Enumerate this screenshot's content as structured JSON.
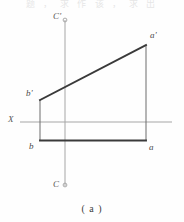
{
  "figure": {
    "caption": "( a )",
    "partial_header_text": "题 ， 求 作 该 ， 求 出",
    "background_color": "#fefefe",
    "axis_color": "#9a9a9a",
    "projection_line_color": "#4d4d4d",
    "heavy_line_color": "#3a3a3a",
    "label_color": "#4a4a4a"
  },
  "axes": {
    "horizontal": {
      "name": "X",
      "label": "X",
      "label_x": 8,
      "label_y": 116,
      "y": 122,
      "x_start": 20,
      "x_end": 172,
      "color": "#a6a6a6"
    },
    "vertical": {
      "name": "C",
      "top_label": "C'",
      "bottom_label": "C",
      "top_label_x": 54,
      "top_label_y": 14,
      "bottom_label_x": 54,
      "bottom_label_y": 182,
      "x": 65,
      "y_start": 20,
      "y_end": 186,
      "color": "#a6a6a6",
      "end_marker": "circle"
    }
  },
  "points": [
    {
      "id": "a-prime",
      "label": "a'",
      "x": 146,
      "y": 45,
      "label_x": 150,
      "label_y": 33,
      "view": "front"
    },
    {
      "id": "b-prime",
      "label": "b'",
      "x": 40,
      "y": 100,
      "label_x": 27,
      "label_y": 90,
      "view": "front"
    },
    {
      "id": "b",
      "label": "b",
      "x": 40,
      "y": 140,
      "label_x": 29,
      "label_y": 142,
      "view": "top"
    },
    {
      "id": "a",
      "label": "a",
      "x": 146,
      "y": 140,
      "label_x": 149,
      "label_y": 142,
      "view": "top"
    }
  ],
  "segments": [
    {
      "id": "front-projection-ab",
      "from": "b-prime",
      "to": "a-prime",
      "x1": 40,
      "y1": 100,
      "x2": 146,
      "y2": 45,
      "weight": "heavy",
      "style": "solid"
    },
    {
      "id": "left-projector",
      "from": "b-prime",
      "to": "b",
      "x1": 40,
      "y1": 100,
      "x2": 40,
      "y2": 140,
      "weight": "light",
      "style": "solid"
    },
    {
      "id": "right-projector",
      "from": "a-prime",
      "to": "a",
      "x1": 146,
      "y1": 45,
      "x2": 146,
      "y2": 140,
      "weight": "light",
      "style": "solid"
    },
    {
      "id": "top-projection-ab",
      "from": "b",
      "to": "a",
      "x1": 40,
      "y1": 140,
      "x2": 146,
      "y2": 140,
      "weight": "heavy",
      "style": "solid"
    }
  ]
}
